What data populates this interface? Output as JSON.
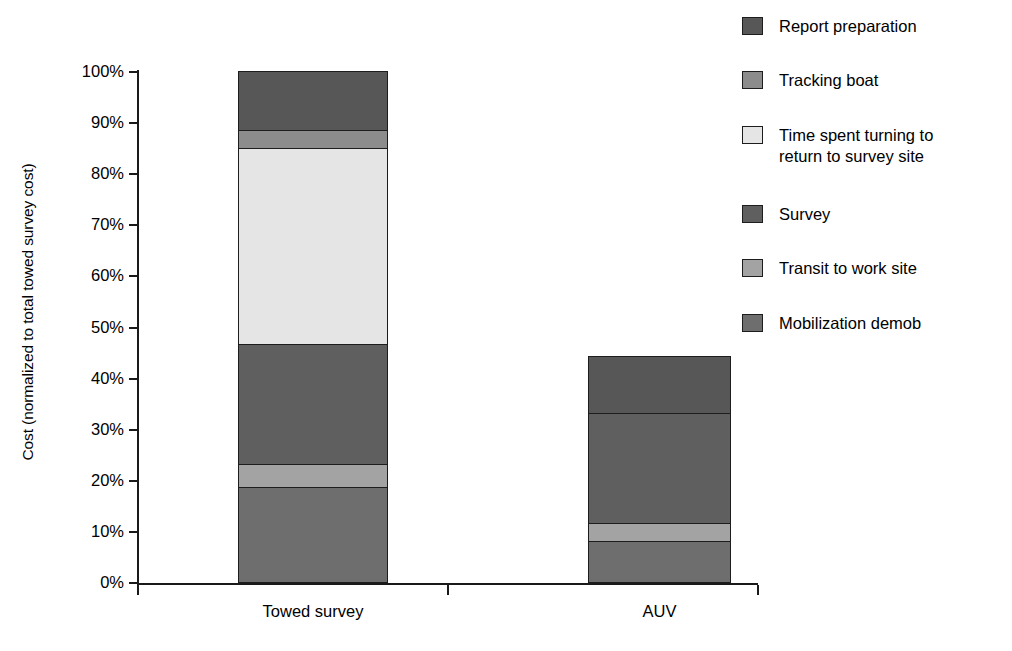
{
  "chart_data": {
    "type": "bar",
    "subtype": "stacked-vertical-100-percent",
    "title": "",
    "xlabel": "",
    "ylabel": "Cost (normalized to total towed survey cost)",
    "categories": [
      "Towed survey",
      "AUV"
    ],
    "ylim": [
      0,
      100
    ],
    "y_unit": "%",
    "y_tick_labels": [
      "100%",
      "90%",
      "80%",
      "70%",
      "60%",
      "50%",
      "40%",
      "30%",
      "20%",
      "10%",
      "0%"
    ],
    "y_tick_values": [
      100,
      90,
      80,
      70,
      60,
      50,
      40,
      30,
      20,
      10,
      0
    ],
    "grid": false,
    "legend_position": "right",
    "series": [
      {
        "name": "Report preparation",
        "color": "#575757",
        "values": [
          11.5,
          11.3
        ],
        "cumulative_top": [
          100.0,
          44.3
        ]
      },
      {
        "name": "Tracking boat",
        "color": "#8c8c8c",
        "values": [
          3.5,
          0
        ],
        "cumulative_top": [
          88.5,
          33.0
        ]
      },
      {
        "name": "Time spent turning to\nreturn to survey site",
        "color": "#e5e5e5",
        "values": [
          38.5,
          0
        ],
        "cumulative_top": [
          85.0,
          33.0
        ]
      },
      {
        "name": "Survey",
        "color": "#5f5f5f",
        "values": [
          23.5,
          21.5
        ],
        "cumulative_top": [
          46.5,
          33.0
        ]
      },
      {
        "name": "Transit to work site",
        "color": "#a3a3a3",
        "values": [
          4.5,
          3.5
        ],
        "cumulative_top": [
          23.0,
          11.5
        ]
      },
      {
        "name": "Mobilization demob",
        "color": "#6e6e6e",
        "values": [
          18.5,
          8.0
        ],
        "cumulative_top": [
          18.5,
          8.0
        ]
      }
    ],
    "bar_totals": [
      100.0,
      44.3
    ]
  },
  "legend": {
    "items": [
      {
        "label": "Report preparation",
        "color": "#575757"
      },
      {
        "label": "Tracking boat",
        "color": "#8c8c8c"
      },
      {
        "label": "Time spent turning to\nreturn to survey site",
        "color": "#e5e5e5"
      },
      {
        "label": "Survey",
        "color": "#5f5f5f"
      },
      {
        "label": "Transit to work site",
        "color": "#a3a3a3"
      },
      {
        "label": "Mobilization demob",
        "color": "#6e6e6e"
      }
    ]
  },
  "axes": {
    "y_title": "Cost (normalized to total towed survey cost)",
    "x_categories": [
      "Towed survey",
      "AUV"
    ]
  },
  "colors": {
    "axis": "#1a1a1a",
    "bar_outline": "#1d1d1d",
    "background": "#ffffff"
  }
}
